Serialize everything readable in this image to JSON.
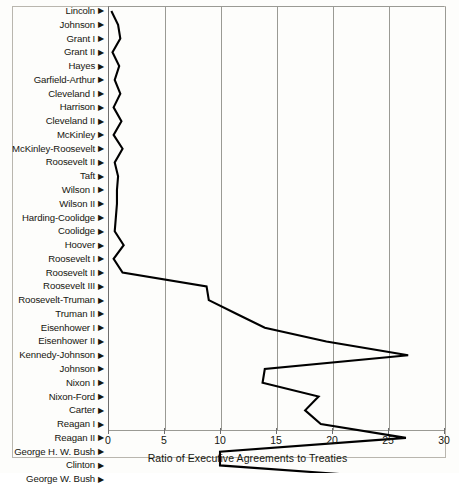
{
  "chart_data": {
    "type": "line",
    "orientation": "horizontal",
    "title": "",
    "subtitle": "",
    "xlabel": "Ratio of Executive Agreements to Treaties",
    "ylabel": "",
    "xlim": [
      0,
      30
    ],
    "xticks": [
      0,
      5,
      10,
      15,
      20,
      25,
      30
    ],
    "xticklabels": [
      "0",
      "5",
      "10",
      "15",
      "20",
      "25",
      "30"
    ],
    "grid": "vertical",
    "legend": "none",
    "line_color": "#000000",
    "grid_color": "#9a9a94",
    "background_color": "#fdfdfb",
    "categories": [
      "Lincoln",
      "Johnson",
      "Grant I",
      "Grant II",
      "Hayes",
      "Garfield-Arthur",
      "Cleveland I",
      "Harrison",
      "Cleveland II",
      "McKinley",
      "McKinley-Roosevelt",
      "Roosevelt II",
      "Taft",
      "Wilson I",
      "Wilson II",
      "Harding-Coolidge",
      "Coolidge",
      "Hoover",
      "Roosevelt I",
      "Roosevelt II",
      "Roosevelt III",
      "Roosevelt-Truman",
      "Truman II",
      "Eisenhower I",
      "Eisenhower II",
      "Kennedy-Johnson",
      "Johnson",
      "Nixon I",
      "Nixon-Ford",
      "Carter",
      "Reagan I",
      "Reagan II",
      "George H. W. Bush",
      "Clinton",
      "George W. Bush"
    ],
    "values": [
      0.3,
      0.9,
      1.1,
      0.4,
      1.0,
      0.6,
      1.1,
      0.5,
      1.2,
      0.5,
      1.3,
      0.6,
      0.9,
      0.8,
      0.8,
      0.7,
      0.6,
      1.4,
      0.5,
      1.3,
      8.8,
      9.0,
      11.5,
      14.0,
      19.5,
      26.8,
      14.0,
      13.8,
      18.8,
      17.6,
      19.0,
      26.6,
      10.0,
      10.0,
      27.0
    ]
  },
  "axis": {
    "x_title": "Ratio of Executive Agreements to Treaties"
  }
}
